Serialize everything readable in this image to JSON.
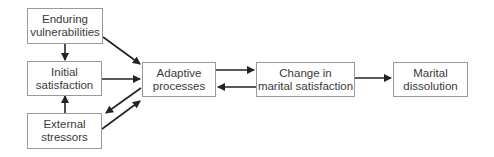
{
  "diagram": {
    "nodes": {
      "enduring": {
        "line1": "Enduring",
        "line2": "vulnerabilities"
      },
      "initial": {
        "line1": "Initial",
        "line2": "satisfaction"
      },
      "external": {
        "line1": "External",
        "line2": "stressors"
      },
      "adaptive": {
        "line1": "Adaptive",
        "line2": "processes"
      },
      "change": {
        "line1": "Change in",
        "line2": "marital satisfaction"
      },
      "dissolution": {
        "line1": "Marital",
        "line2": "dissolution"
      }
    },
    "edges": [
      {
        "from": "enduring",
        "to": "initial"
      },
      {
        "from": "external",
        "to": "initial"
      },
      {
        "from": "enduring",
        "to": "adaptive"
      },
      {
        "from": "initial",
        "to": "adaptive"
      },
      {
        "from": "adaptive",
        "to": "external"
      },
      {
        "from": "external",
        "to": "adaptive"
      },
      {
        "from": "adaptive",
        "to": "change"
      },
      {
        "from": "change",
        "to": "adaptive"
      },
      {
        "from": "change",
        "to": "dissolution"
      }
    ],
    "colors": {
      "border": "#9a9a9a",
      "arrow": "#222222",
      "text": "#3a3a3a"
    }
  }
}
